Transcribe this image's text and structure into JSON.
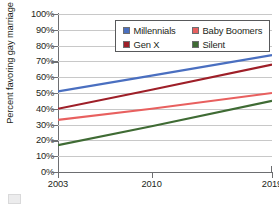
{
  "chart_data": {
    "type": "line",
    "title": "",
    "xlabel": "",
    "ylabel": "Percent favoring gay marriage",
    "x": [
      2003,
      2010,
      2019
    ],
    "xlim": [
      2003,
      2019
    ],
    "ylim": [
      0,
      100
    ],
    "grid": true,
    "legend_position": "top-right-inside",
    "x_tick_labels": [
      "2003",
      "2010",
      "2019"
    ],
    "y_tick_labels": [
      "0%",
      "10%",
      "20%",
      "30%",
      "40%",
      "50%",
      "60%",
      "70%",
      "80%",
      "90%",
      "100%"
    ],
    "y_tick_values": [
      0,
      10,
      20,
      30,
      40,
      50,
      60,
      70,
      80,
      90,
      100
    ],
    "series": [
      {
        "name": "Millennials",
        "color": "#4a6fc0",
        "values": [
          51,
          61,
          74
        ]
      },
      {
        "name": "Baby Boomers",
        "color": "#e8605f",
        "values": [
          33,
          40,
          50
        ]
      },
      {
        "name": "Gen X",
        "color": "#9e1f28",
        "values": [
          40,
          52,
          68
        ]
      },
      {
        "name": "Silent",
        "color": "#3f6b34",
        "values": [
          17,
          29,
          45
        ]
      }
    ]
  },
  "legend": {
    "entries": [
      {
        "label": "Millennials",
        "color": "#4a6fc0"
      },
      {
        "label": "Baby Boomers",
        "color": "#e8605f"
      },
      {
        "label": "Gen X",
        "color": "#9e1f28"
      },
      {
        "label": "Silent",
        "color": "#3f6b34"
      }
    ]
  }
}
